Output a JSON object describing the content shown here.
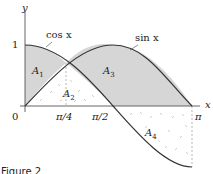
{
  "figure": {
    "axes": {
      "x_label": "x",
      "y_label": "y",
      "origin_label": "0",
      "y_tick_label": "1",
      "x_ticks": [
        "π/4",
        "π/2",
        "π"
      ]
    },
    "curves": [
      {
        "name": "cos x",
        "label": "cos x",
        "color": "#333333"
      },
      {
        "name": "sin x",
        "label": "sin x",
        "color": "#333333"
      }
    ],
    "regions": [
      {
        "name": "A1",
        "label": "A",
        "subscript": "1",
        "fill": "#d9d9d9",
        "pattern": "solid"
      },
      {
        "name": "A2",
        "label": "A",
        "subscript": "2",
        "fill": "#ffffff",
        "pattern": "dashed-speckle"
      },
      {
        "name": "A3",
        "label": "A",
        "subscript": "3",
        "fill": "#d9d9d9",
        "pattern": "solid"
      },
      {
        "name": "A4",
        "label": "A",
        "subscript": "4",
        "fill": "#ffffff",
        "pattern": "dashed-speckle"
      }
    ],
    "caption": "Figure 2"
  }
}
